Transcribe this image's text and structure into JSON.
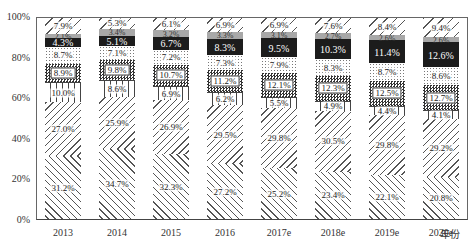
{
  "chart_data": {
    "type": "bar",
    "stacked": true,
    "percent": true,
    "title": "",
    "xlabel": "年份",
    "ylabel": "",
    "ylim": [
      0,
      100
    ],
    "y_ticks": [
      "0%",
      "20%",
      "40%",
      "60%",
      "80%",
      "100%"
    ],
    "categories": [
      "2013",
      "2014",
      "2015",
      "2016",
      "2017e",
      "2018e",
      "2019e",
      "2020e"
    ],
    "series": [
      {
        "name": "segment-1 (bottom, forward hatch)",
        "values": [
          31.2,
          34.7,
          32.3,
          27.2,
          25.2,
          23.4,
          22.1,
          20.8
        ]
      },
      {
        "name": "segment-2 (back hatch)",
        "values": [
          27.0,
          25.9,
          26.9,
          29.5,
          29.8,
          30.5,
          29.8,
          29.2
        ]
      },
      {
        "name": "segment-3 (vertical lines)",
        "values": [
          10.0,
          8.6,
          6.9,
          6.2,
          5.5,
          4.9,
          4.4,
          4.1
        ]
      },
      {
        "name": "segment-4 (checkered)",
        "values": [
          8.9,
          9.8,
          10.7,
          11.2,
          12.1,
          12.3,
          12.5,
          12.7
        ]
      },
      {
        "name": "segment-5 (dotted)",
        "values": [
          8.7,
          7.1,
          7.2,
          7.3,
          7.9,
          8.3,
          8.7,
          8.6
        ]
      },
      {
        "name": "segment-6 (black)",
        "values": [
          4.3,
          5.1,
          6.7,
          8.3,
          9.5,
          10.3,
          11.4,
          12.6
        ]
      },
      {
        "name": "segment-7 (light gray)",
        "values": [
          2.1,
          3.4,
          3.2,
          3.3,
          3.1,
          2.7,
          2.6,
          2.6
        ]
      },
      {
        "name": "segment-8 (top, back hatch)",
        "values": [
          7.9,
          5.3,
          6.1,
          6.9,
          6.9,
          7.6,
          8.4,
          9.4
        ]
      }
    ],
    "legend": "cut off at bottom edge (not legible)",
    "grid": false
  }
}
